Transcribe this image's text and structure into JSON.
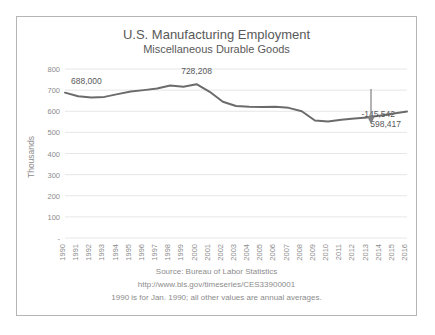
{
  "card": {
    "border_color": "#b5b5b5",
    "background": "#ffffff"
  },
  "chart_data": {
    "type": "line",
    "title": "U.S. Manufacturing Employment",
    "subtitle": "Miscellaneous Durable Goods",
    "xlabel": "",
    "ylabel": "Thousands",
    "ylim": [
      0,
      800
    ],
    "ytick_values": [
      0,
      100,
      200,
      300,
      400,
      500,
      600,
      700,
      800
    ],
    "ytick_labels": [
      "-",
      "100",
      "200",
      "300",
      "400",
      "500",
      "600",
      "700",
      "800"
    ],
    "grid": true,
    "legend": "none",
    "line_color": "#6b6b6b",
    "categories": [
      "1990",
      "1991",
      "1992",
      "1993",
      "1994",
      "1995",
      "1996",
      "1997",
      "1998",
      "1999",
      "2000",
      "2001",
      "2002",
      "2003",
      "2004",
      "2005",
      "2006",
      "2007",
      "2008",
      "2009",
      "2010",
      "2011",
      "2012",
      "2013",
      "2014",
      "2015",
      "2016"
    ],
    "values": [
      688.0,
      671.0,
      665.0,
      668.0,
      681.0,
      693.0,
      700.0,
      708.0,
      722.0,
      716.0,
      728.2,
      692.0,
      645.0,
      625.0,
      621.0,
      620.0,
      621.0,
      616.0,
      600.0,
      556.0,
      552.0,
      560.0,
      566.0,
      571.0,
      580.0,
      589.0,
      598.4
    ],
    "annotations": [
      {
        "name": "start-value-label",
        "text": "688,000",
        "category": "1990",
        "value": 688.0
      },
      {
        "name": "peak-value-label",
        "text": "728,208",
        "category": "2000",
        "value": 728.2
      },
      {
        "name": "change-label",
        "text": "-145,542",
        "category": "2016",
        "value": 0
      },
      {
        "name": "end-value-label",
        "text": "598,417",
        "category": "2016",
        "value": 598.4
      }
    ]
  },
  "footer": {
    "line1": "Source: Bureau of Labor Statistics",
    "line2": "http://www.bls.gov/timeseries/CES33900001",
    "line3": "1990 is for Jan. 1990; all other values are annual averages."
  }
}
